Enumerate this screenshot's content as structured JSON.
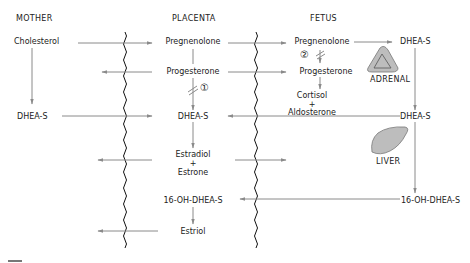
{
  "headers": {
    "mother": "MOTHER",
    "placenta": "PLACENTA",
    "fetus": "FETUS"
  },
  "mother": {
    "cholesterol": "Cholesterol",
    "dheas": "DHEA-S"
  },
  "placenta": {
    "pregnenolone": "Pregnenolone",
    "progesterone": "Progesterone",
    "enzyme1": "①",
    "dheas": "DHEA-S",
    "estradiol": "Estradiol",
    "plus1": "+",
    "estrone": "Estrone",
    "oh_dheas": "16-OH-DHEA-S",
    "estriol": "Estriol"
  },
  "fetus": {
    "pregnenolone": "Pregnenolone",
    "enzyme2": "②",
    "progesterone": "Progesterone",
    "cortisol": "Cortisol",
    "plus": "+",
    "aldosterone": "Aldosterone",
    "dheas_adrenal": "DHEA-S",
    "adrenal_label": "ADRENAL",
    "dheas_liver": "DHEA-S",
    "liver_label": "LIVER",
    "oh_dheas": "16-OH-DHEA-S"
  },
  "colors": {
    "arrow": "#8a8a8a",
    "membrane": "#111111",
    "organ_fill": "#bdbdbd",
    "text": "#222222"
  }
}
